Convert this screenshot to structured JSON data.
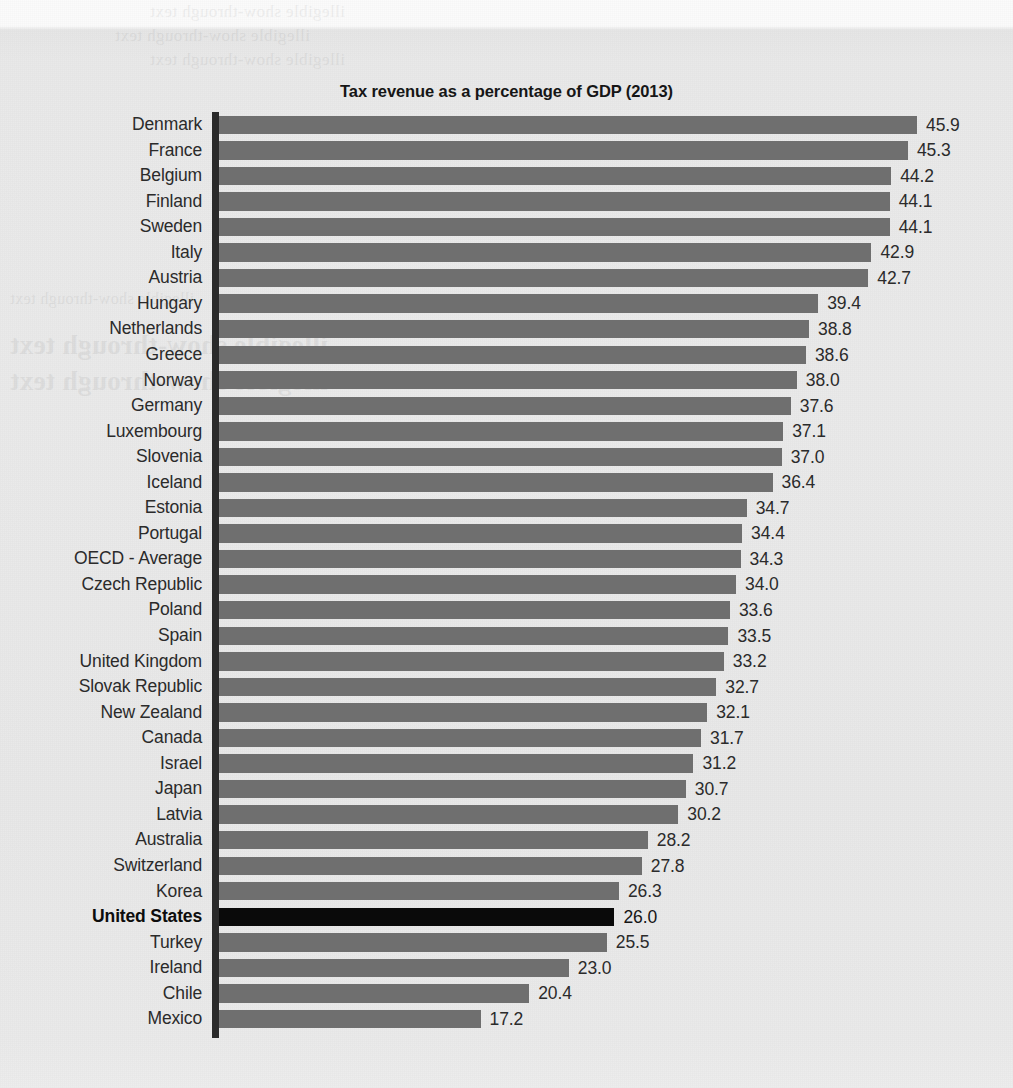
{
  "chart_data": {
    "type": "bar",
    "orientation": "horizontal",
    "title": "Tax revenue as a percentage of GDP (2013)",
    "xlabel": "",
    "ylabel": "",
    "xlim": [
      0,
      45.9
    ],
    "grid": false,
    "legend": null,
    "value_labels": true,
    "highlight_category": "United States",
    "colors": {
      "bar": "#6f6f6f",
      "highlight_bar": "#0a0a0a",
      "background": "#e9e9e9",
      "axis": "#2a2a2a",
      "text": "#2b2b2b"
    },
    "categories": [
      "Denmark",
      "France",
      "Belgium",
      "Finland",
      "Sweden",
      "Italy",
      "Austria",
      "Hungary",
      "Netherlands",
      "Greece",
      "Norway",
      "Germany",
      "Luxembourg",
      "Slovenia",
      "Iceland",
      "Estonia",
      "Portugal",
      "OECD - Average",
      "Czech Republic",
      "Poland",
      "Spain",
      "United Kingdom",
      "Slovak Republic",
      "New Zealand",
      "Canada",
      "Israel",
      "Japan",
      "Latvia",
      "Australia",
      "Switzerland",
      "Korea",
      "United States",
      "Turkey",
      "Ireland",
      "Chile",
      "Mexico"
    ],
    "values": [
      45.9,
      45.3,
      44.2,
      44.1,
      44.1,
      42.9,
      42.7,
      39.4,
      38.8,
      38.6,
      38.0,
      37.6,
      37.1,
      37.0,
      36.4,
      34.7,
      34.4,
      34.3,
      34.0,
      33.6,
      33.5,
      33.2,
      32.7,
      32.1,
      31.7,
      31.2,
      30.7,
      30.2,
      28.2,
      27.8,
      26.3,
      26.0,
      25.5,
      23.0,
      20.4,
      17.2
    ],
    "value_labels_text": [
      "45.9",
      "45.3",
      "44.2",
      "44.1",
      "44.1",
      "42.9",
      "42.7",
      "39.4",
      "38.8",
      "38.6",
      "38.0",
      "37.6",
      "37.1",
      "37.0",
      "36.4",
      "34.7",
      "34.4",
      "34.3",
      "34.0",
      "33.6",
      "33.5",
      "33.2",
      "32.7",
      "32.1",
      "31.7",
      "31.2",
      "30.7",
      "30.2",
      "28.2",
      "27.8",
      "26.3",
      "26.0",
      "25.5",
      "23.0",
      "20.4",
      "17.2"
    ]
  },
  "page_bleed_text": {
    "line1": "illegible show-through text",
    "line2": "illegible show-through text",
    "line3": "illegible show-through text",
    "line4": "illegible show-through text",
    "line5": "illegible show-through text",
    "line6": "illegible show-through text"
  }
}
